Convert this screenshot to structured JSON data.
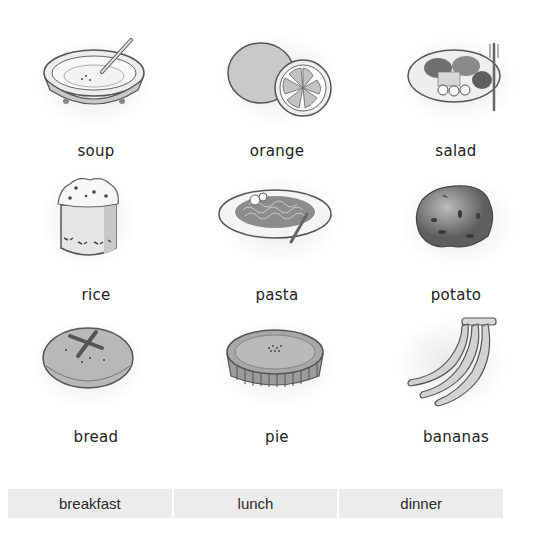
{
  "worksheet": {
    "items": [
      {
        "label": "soup",
        "icon": "soup-bowl-icon"
      },
      {
        "label": "orange",
        "icon": "orange-icon"
      },
      {
        "label": "salad",
        "icon": "salad-plate-icon"
      },
      {
        "label": "rice",
        "icon": "rice-bowl-icon"
      },
      {
        "label": "pasta",
        "icon": "pasta-plate-icon"
      },
      {
        "label": "potato",
        "icon": "potato-icon"
      },
      {
        "label": "bread",
        "icon": "bread-loaf-icon"
      },
      {
        "label": "pie",
        "icon": "pie-icon"
      },
      {
        "label": "bananas",
        "icon": "bananas-icon"
      }
    ],
    "meals": [
      {
        "label": "breakfast"
      },
      {
        "label": "lunch"
      },
      {
        "label": "dinner"
      }
    ]
  }
}
